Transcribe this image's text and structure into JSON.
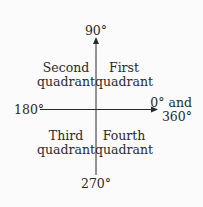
{
  "diagram": {
    "axes": {
      "top_label": "90°",
      "left_label": "180°",
      "right_label_line1": "0° and",
      "right_label_line2": "360°",
      "bottom_label": "270°"
    },
    "quadrants": [
      {
        "name": "first",
        "line1": "First",
        "line2": "quadrant"
      },
      {
        "name": "second",
        "line1": "Second",
        "line2": "quadrant"
      },
      {
        "name": "third",
        "line1": "Third",
        "line2": "quadrant"
      },
      {
        "name": "fourth",
        "line1": "Fourth",
        "line2": "quadrant"
      }
    ],
    "colors": {
      "axis": "#2a2a2a",
      "text": "#2a2a2a",
      "background": "#fbfbfb"
    }
  }
}
